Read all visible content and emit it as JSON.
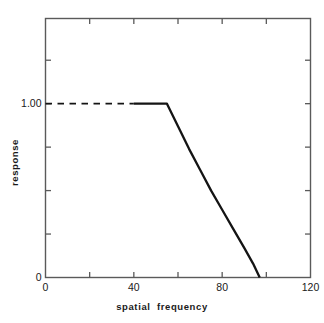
{
  "chart_data": {
    "type": "line",
    "title": "",
    "xlabel": "spatial  frequency",
    "ylabel": "response",
    "xlim": [
      0,
      120
    ],
    "ylim": [
      0,
      1.49
    ],
    "grid": false,
    "legend": null,
    "x_ticks": [
      0,
      20,
      40,
      60,
      80,
      100,
      120
    ],
    "x_tick_labels": [
      "0",
      "",
      "40",
      "",
      "80",
      "",
      "120"
    ],
    "y_ticks": [
      0.0,
      0.25,
      0.5,
      0.75,
      1.0,
      1.25
    ],
    "y_tick_labels": [
      "0",
      "",
      "",
      "",
      "1.00",
      ""
    ],
    "series": [
      {
        "name": "response (extrapolated)",
        "style": "dashed",
        "x": [
          0,
          40
        ],
        "y": [
          1.0,
          1.0
        ]
      },
      {
        "name": "response (measured)",
        "style": "solid",
        "x": [
          40,
          47,
          55,
          60,
          65,
          70,
          75,
          80,
          85,
          90,
          94,
          97
        ],
        "y": [
          1.0,
          1.0,
          1.0,
          0.87,
          0.74,
          0.62,
          0.5,
          0.39,
          0.28,
          0.17,
          0.08,
          0.0
        ]
      }
    ],
    "annotations": []
  },
  "axis_labels": {
    "x_title": "spatial  frequency",
    "y_title": "response",
    "x_tick_0": "0",
    "x_tick_40": "40",
    "x_tick_80": "80",
    "x_tick_120": "120",
    "y_tick_0": "0",
    "y_tick_100": "1.00"
  },
  "colors": {
    "background": "#ffffff",
    "frame": "#5a5a5a",
    "curve": "#141414",
    "text": "#1a1a1a"
  }
}
